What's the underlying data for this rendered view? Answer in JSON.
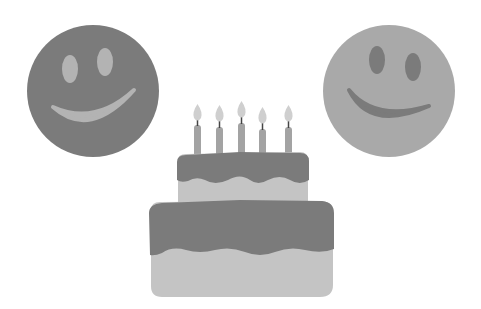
{
  "scene": {
    "description": "Two smiley faces flanking a two-tier birthday cake with five candles",
    "colors": {
      "background": "#ffffff",
      "dark_gray": "#7b7b7b",
      "light_gray": "#aaaaaa",
      "pale_gray": "#c4c4c4",
      "flame": "#cfcfcf",
      "wick": "#444444"
    },
    "smileys": [
      {
        "name": "left-smiley",
        "fill": "#7b7b7b",
        "features": "#b3b3b3"
      },
      {
        "name": "right-smiley",
        "fill": "#a9a9a9",
        "features": "#7b7b7b"
      }
    ],
    "cake": {
      "tiers": 2,
      "candle_count": 5
    }
  }
}
